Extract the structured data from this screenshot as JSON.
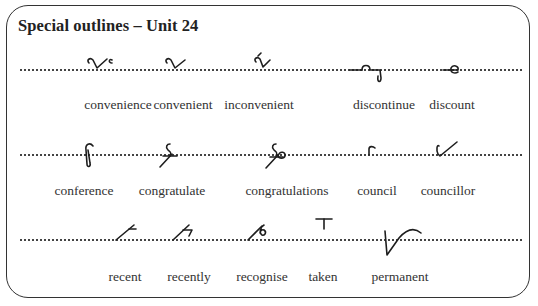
{
  "title": "Special outlines – Unit 24",
  "rows": [
    {
      "items": [
        {
          "word": "convenience",
          "outline_icon": "shorthand-convenience"
        },
        {
          "word": "convenient",
          "outline_icon": "shorthand-convenient"
        },
        {
          "word": "inconvenient",
          "outline_icon": "shorthand-inconvenient"
        },
        {
          "word": "discontinue",
          "outline_icon": "shorthand-discontinue"
        },
        {
          "word": "discount",
          "outline_icon": "shorthand-discount"
        }
      ]
    },
    {
      "items": [
        {
          "word": "conference",
          "outline_icon": "shorthand-conference"
        },
        {
          "word": "congratulate",
          "outline_icon": "shorthand-congratulate"
        },
        {
          "word": "congratulations",
          "outline_icon": "shorthand-congratulations"
        },
        {
          "word": "council",
          "outline_icon": "shorthand-council"
        },
        {
          "word": "councillor",
          "outline_icon": "shorthand-councillor"
        }
      ]
    },
    {
      "items": [
        {
          "word": "recent",
          "outline_icon": "shorthand-recent"
        },
        {
          "word": "recently",
          "outline_icon": "shorthand-recently"
        },
        {
          "word": "recognise",
          "outline_icon": "shorthand-recognise"
        },
        {
          "word": "taken",
          "outline_icon": "shorthand-taken"
        },
        {
          "word": "permanent",
          "outline_icon": "shorthand-permanent"
        }
      ]
    }
  ]
}
